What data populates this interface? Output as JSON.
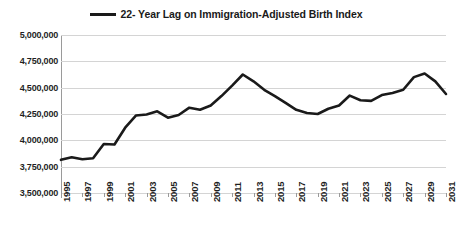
{
  "chart_data": {
    "type": "line",
    "title": "",
    "xlabel": "",
    "ylabel": "",
    "legend": [
      "22- Year Lag on Immigration-Adjusted Birth Index"
    ],
    "legend_position": "top-center",
    "grid": true,
    "line_color": "#1a1a1a",
    "ylim": [
      3500000,
      5000000
    ],
    "ytick_values": [
      5000000,
      4750000,
      4500000,
      4250000,
      4000000,
      3750000,
      3500000
    ],
    "ytick_labels": [
      "5,000,000",
      "4,750,000",
      "4,500,000",
      "4,250,000",
      "4,000,000",
      "3,750,000",
      "3,500,000"
    ],
    "xlim": [
      1995,
      2031
    ],
    "xtick_labels": [
      "1995",
      "1997",
      "1999",
      "2001",
      "2003",
      "2005",
      "2007",
      "2009",
      "2011",
      "2013",
      "2015",
      "2017",
      "2019",
      "2021",
      "2023",
      "2025",
      "2027",
      "2029",
      "2031"
    ],
    "x": [
      1995,
      1996,
      1997,
      1998,
      1999,
      2000,
      2001,
      2002,
      2003,
      2004,
      2005,
      2006,
      2007,
      2008,
      2009,
      2010,
      2011,
      2012,
      2013,
      2014,
      2015,
      2016,
      2017,
      2018,
      2019,
      2020,
      2021,
      2022,
      2023,
      2024,
      2025,
      2026,
      2027,
      2028,
      2029,
      2030,
      2031
    ],
    "values": [
      3815000,
      3840000,
      3820000,
      3830000,
      3965000,
      3960000,
      4120000,
      4235000,
      4245000,
      4275000,
      4215000,
      4240000,
      4310000,
      4290000,
      4330000,
      4420000,
      4520000,
      4625000,
      4560000,
      4480000,
      4420000,
      4355000,
      4290000,
      4260000,
      4250000,
      4300000,
      4330000,
      4425000,
      4380000,
      4375000,
      4430000,
      4450000,
      4480000,
      4600000,
      4635000,
      4560000,
      4440000
    ]
  }
}
